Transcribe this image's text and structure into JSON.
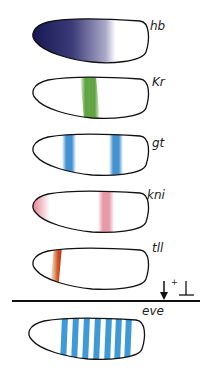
{
  "figure": {
    "rows": [
      {
        "gene": "hb",
        "color": "#1a1a5e",
        "pattern": "anterior gradient"
      },
      {
        "gene": "Kr",
        "color": "#4f9a2e",
        "pattern": "central band"
      },
      {
        "gene": "gt",
        "color": "#3b8fd0",
        "pattern": "two bands"
      },
      {
        "gene": "kni",
        "color": "#d9566e",
        "pattern": "anterior cap and posterior band"
      },
      {
        "gene": "tll",
        "color": "#c8381a",
        "pattern": "anterior narrow band"
      }
    ],
    "legend": {
      "activation_symbol": "↓",
      "plus": "+",
      "repression_symbol": "⊥"
    },
    "result": {
      "gene": "eve",
      "color": "#3d9ad6",
      "stripe_count": 7
    }
  }
}
